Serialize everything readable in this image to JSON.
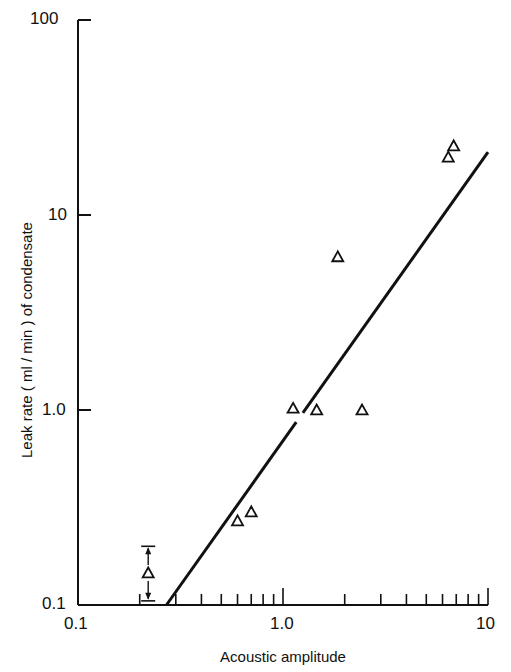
{
  "chart_data": {
    "type": "scatter",
    "title": "",
    "xlabel": "Acoustic amplitude",
    "ylabel": "Leak rate ( ml / min ) of condensate",
    "xscale": "log",
    "yscale": "log",
    "xlim": [
      0.1,
      10
    ],
    "ylim": [
      0.1,
      100
    ],
    "x_tick_labels": [
      "0.1",
      "1.0",
      "10"
    ],
    "y_tick_labels": [
      "0.1",
      "1.0",
      "10",
      "100"
    ],
    "grid": false,
    "legend": null,
    "marker": "open-triangle",
    "series": [
      {
        "name": "measured",
        "points": [
          {
            "x": 0.6,
            "y": 0.27
          },
          {
            "x": 0.7,
            "y": 0.3
          },
          {
            "x": 1.12,
            "y": 1.02
          },
          {
            "x": 1.46,
            "y": 1.0
          },
          {
            "x": 1.85,
            "y": 6.1
          },
          {
            "x": 2.43,
            "y": 1.0
          },
          {
            "x": 6.4,
            "y": 19.8
          },
          {
            "x": 6.8,
            "y": 22.6
          }
        ]
      },
      {
        "name": "range-point",
        "points": [
          {
            "x": 0.22,
            "y": 0.146,
            "y_low": 0.105,
            "y_high": 0.2
          }
        ]
      }
    ],
    "fit_line": {
      "type": "power-law",
      "from": {
        "x": 0.27,
        "y": 0.1
      },
      "to": {
        "x": 10,
        "y": 21
      }
    }
  },
  "axes": {
    "x": {
      "label": "Acoustic amplitude",
      "ticks": [
        "0.1",
        "1.0",
        "10"
      ]
    },
    "y": {
      "label": "Leak rate ( ml / min ) of condensate",
      "ticks": [
        "100",
        "10",
        "1.0",
        "0.1"
      ]
    }
  }
}
